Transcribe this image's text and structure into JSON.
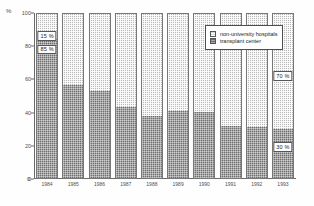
{
  "chart_data": {
    "type": "bar",
    "subtype": "100-percent-stacked-bar",
    "title": "",
    "xlabel": "",
    "ylabel": "%",
    "ylim": [
      0,
      100
    ],
    "yticks": [
      0,
      20,
      40,
      60,
      80,
      100
    ],
    "grid": false,
    "legend_position": "upper-right-inside",
    "categories": [
      "1984",
      "1985",
      "1986",
      "1987",
      "1988",
      "1989",
      "1990",
      "1991",
      "1992",
      "1993"
    ],
    "series": [
      {
        "name": "transplant center",
        "color": "#6e6e6e",
        "values": [
          85,
          57,
          53,
          43,
          38,
          41,
          40,
          32,
          31,
          30
        ]
      },
      {
        "name": "non-university hospitals",
        "color": "#b9b9b9",
        "values": [
          15,
          43,
          47,
          57,
          62,
          59,
          60,
          68,
          69,
          70
        ]
      }
    ],
    "annotations": [
      {
        "text": "15 %",
        "category": "1984",
        "series": "non-university hospitals"
      },
      {
        "text": "85 %",
        "category": "1984",
        "series": "transplant center"
      },
      {
        "text": "70 %",
        "category": "1993",
        "series": "non-university hospitals"
      },
      {
        "text": "30 %",
        "category": "1993",
        "series": "transplant center"
      }
    ]
  },
  "axis": {
    "y_title": "%",
    "x_origin_label": "0",
    "y_ticks": [
      {
        "label": "100",
        "value": 100
      },
      {
        "label": "80",
        "value": 80
      },
      {
        "label": "60",
        "value": 60
      },
      {
        "label": "40",
        "value": 40
      },
      {
        "label": "20",
        "value": 20
      },
      {
        "label": "0",
        "value": 0
      }
    ]
  },
  "legend": {
    "items": [
      {
        "label": "non-university hospitals",
        "swatch": "light"
      },
      {
        "label": "transplant center",
        "swatch": "dark"
      }
    ]
  }
}
